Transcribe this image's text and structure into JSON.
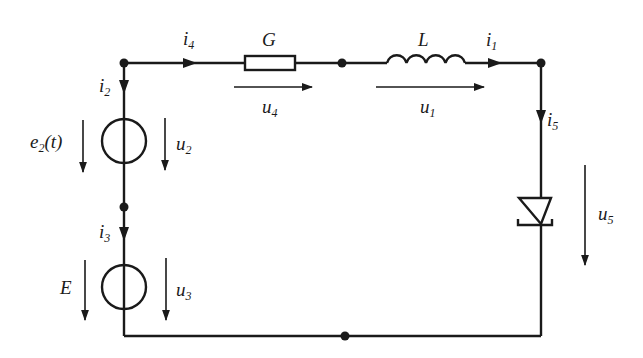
{
  "diagram": {
    "type": "electrical-circuit",
    "components": {
      "conductance": {
        "label": "G"
      },
      "inductor": {
        "label": "L"
      },
      "source_e2": {
        "label_main": "e",
        "label_sub": "2",
        "label_suffix": "(t)"
      },
      "source_E": {
        "label": "E"
      },
      "diode": {
        "label": ""
      }
    },
    "currents": {
      "i1": {
        "main": "i",
        "sub": "1"
      },
      "i2": {
        "main": "i",
        "sub": "2"
      },
      "i3": {
        "main": "i",
        "sub": "3"
      },
      "i4": {
        "main": "i",
        "sub": "4"
      },
      "i5": {
        "main": "i",
        "sub": "5"
      }
    },
    "voltages": {
      "u1": {
        "main": "u",
        "sub": "1"
      },
      "u2": {
        "main": "u",
        "sub": "2"
      },
      "u3": {
        "main": "u",
        "sub": "3"
      },
      "u4": {
        "main": "u",
        "sub": "4"
      },
      "u5": {
        "main": "u",
        "sub": "5"
      }
    },
    "colors": {
      "ink": "#1a1a1a",
      "background": "#ffffff"
    }
  }
}
